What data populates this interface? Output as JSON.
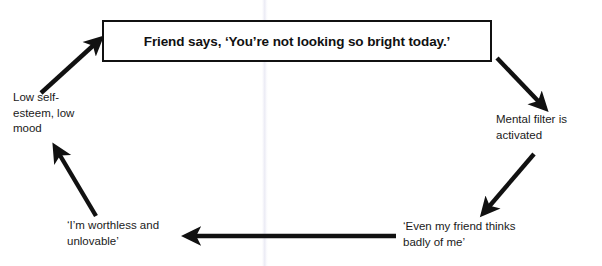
{
  "diagram": {
    "title_box": {
      "text": "Friend says, ‘You’re not looking so bright today.’"
    },
    "nodes": [
      {
        "id": "low-self-esteem",
        "text": "Low self-\nesteem, low\nmood"
      },
      {
        "id": "mental-filter",
        "text": "Mental filter is\nactivated"
      },
      {
        "id": "even-my-friend",
        "text": "‘Even my friend thinks\nbadly of me’"
      },
      {
        "id": "im-worthless",
        "text": "‘I’m worthless and\nunlovable’"
      }
    ],
    "arrows": [
      {
        "id": "arrow-mood-to-trigger",
        "from": "low-self-esteem",
        "to": "title_box",
        "direction": "up-right"
      },
      {
        "id": "arrow-trigger-to-filter",
        "from": "title_box",
        "to": "mental-filter",
        "direction": "down-right"
      },
      {
        "id": "arrow-filter-to-thought",
        "from": "mental-filter",
        "to": "even-my-friend",
        "direction": "down-left"
      },
      {
        "id": "arrow-thought-to-belief",
        "from": "even-my-friend",
        "to": "im-worthless",
        "direction": "left"
      },
      {
        "id": "arrow-belief-to-mood",
        "from": "im-worthless",
        "to": "low-self-esteem",
        "direction": "up-left"
      }
    ],
    "colors": {
      "stroke": "#111111",
      "text": "#1a1a1a",
      "background": "#ffffff"
    }
  }
}
